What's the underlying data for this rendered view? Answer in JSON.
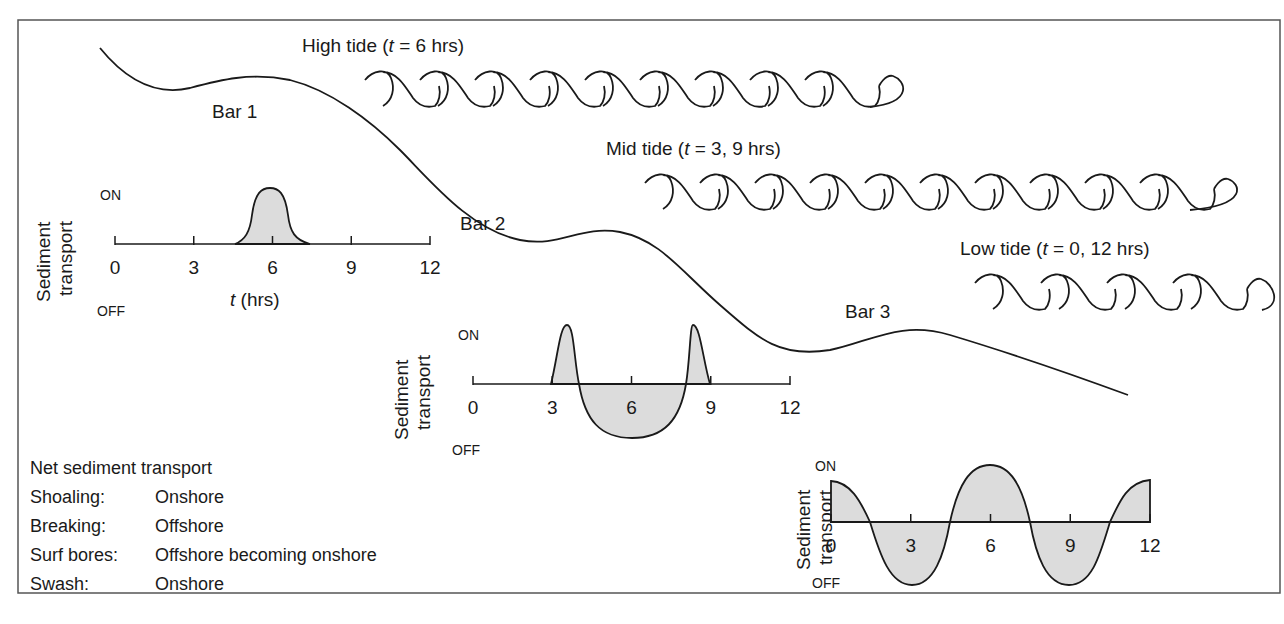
{
  "tide_labels": {
    "high": "High tide (t = 6 hrs)",
    "high_pre": "High tide (",
    "high_t": "t",
    "high_post": " = 6 hrs)",
    "mid_pre": "Mid tide (",
    "mid_t": "t",
    "mid_post": " = 3, 9 hrs)",
    "low_pre": "Low tide (",
    "low_t": "t",
    "low_post": " = 0, 12 hrs)"
  },
  "bars": {
    "bar1": "Bar 1",
    "bar2": "Bar 2",
    "bar3": "Bar 3"
  },
  "plot_common": {
    "y_title_line1": "Sediment",
    "y_title_line2": "transport",
    "on": "ON",
    "off": "OFF",
    "ticks": [
      "0",
      "3",
      "6",
      "9",
      "12"
    ],
    "x_title_t": "t",
    "x_title_rest": " (hrs)"
  },
  "legend": {
    "title": "Net sediment transport",
    "rows": [
      {
        "key": "Shoaling:",
        "value": "Onshore"
      },
      {
        "key": "Breaking:",
        "value": "Offshore"
      },
      {
        "key": "Surf bores:",
        "value": "Offshore becoming onshore"
      },
      {
        "key": "Swash:",
        "value": "Onshore"
      }
    ]
  },
  "colors": {
    "line": "#1a1a1a",
    "fill": "#dcdcdc",
    "frame": "#555555"
  },
  "chart_data": [
    {
      "type": "area",
      "title": "Bar 1 sediment transport",
      "xlabel": "t (hrs)",
      "ylabel": "Sediment transport",
      "x_ticks": [
        0,
        3,
        6,
        9,
        12
      ],
      "y_range_labels": [
        "OFF",
        "ON"
      ],
      "description": "Single onshore pulse centred at high tide",
      "x": [
        0,
        4.5,
        5.5,
        6,
        6.5,
        7.5,
        12
      ],
      "y": [
        0,
        0,
        0.8,
        1.0,
        0.8,
        0,
        0
      ]
    },
    {
      "type": "area",
      "title": "Bar 2 sediment transport",
      "xlabel": "t (hrs)",
      "ylabel": "Sediment transport",
      "x_ticks": [
        0,
        3,
        6,
        9,
        12
      ],
      "y_range_labels": [
        "OFF",
        "ON"
      ],
      "description": "Onshore peaks near t=3.5 and t=8.5, offshore trough centred at t=6",
      "x": [
        3,
        3.5,
        4.1,
        6,
        7.9,
        8.5,
        9
      ],
      "y": [
        0,
        1.0,
        0,
        -0.6,
        0,
        1.0,
        0
      ]
    },
    {
      "type": "area",
      "title": "Bar 3 sediment transport",
      "xlabel": "t (hrs)",
      "ylabel": "Sediment transport",
      "x_ticks": [
        0,
        3,
        6,
        9,
        12
      ],
      "y_range_labels": [
        "OFF",
        "ON"
      ],
      "description": "Oscillating: onshore at 0, 6, 12; offshore troughs at 3 and 9",
      "x": [
        0,
        1.5,
        3,
        4.5,
        6,
        7.5,
        9,
        10.5,
        12
      ],
      "y": [
        0.7,
        0,
        -1.0,
        0,
        1.0,
        0,
        -1.0,
        0,
        0.7
      ]
    }
  ]
}
